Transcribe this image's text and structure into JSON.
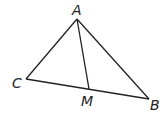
{
  "figure": {
    "type": "triangle-with-median",
    "points": {
      "A": {
        "label": "A",
        "x": 77,
        "y": 19,
        "lx": 72,
        "ly": 15
      },
      "B": {
        "label": "B",
        "x": 149,
        "y": 99,
        "lx": 150,
        "ly": 110
      },
      "C": {
        "label": "C",
        "x": 26,
        "y": 79,
        "lx": 12,
        "ly": 88
      },
      "M": {
        "label": "M",
        "x": 89,
        "y": 89,
        "lx": 81,
        "ly": 106
      }
    },
    "segments": [
      [
        "A",
        "B"
      ],
      [
        "B",
        "C"
      ],
      [
        "C",
        "A"
      ],
      [
        "A",
        "M"
      ]
    ],
    "stroke_color": "#222222"
  }
}
